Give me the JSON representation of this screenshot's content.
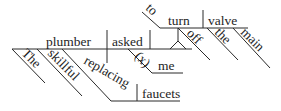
{
  "diagram": {
    "type": "sentence-diagram",
    "sentence": "The skillful plumber replacing faucets asked me to turn off the main valve.",
    "subject": "plumber",
    "verb": "asked",
    "implied_marker": "(x)",
    "indirect_object": "me",
    "infinitive_marker": "to",
    "infinitive_verb": "turn",
    "infinitive_object": "valve",
    "modifiers": {
      "subject_article": "The",
      "subject_adjective": "skillful",
      "participle": "replacing",
      "participle_object": "faucets",
      "adverb": "off",
      "object_article": "the",
      "object_adjective": "main"
    },
    "colors": {
      "line": "#2a2a2a",
      "text": "#1e1e1e",
      "background": "#ffffff"
    }
  }
}
